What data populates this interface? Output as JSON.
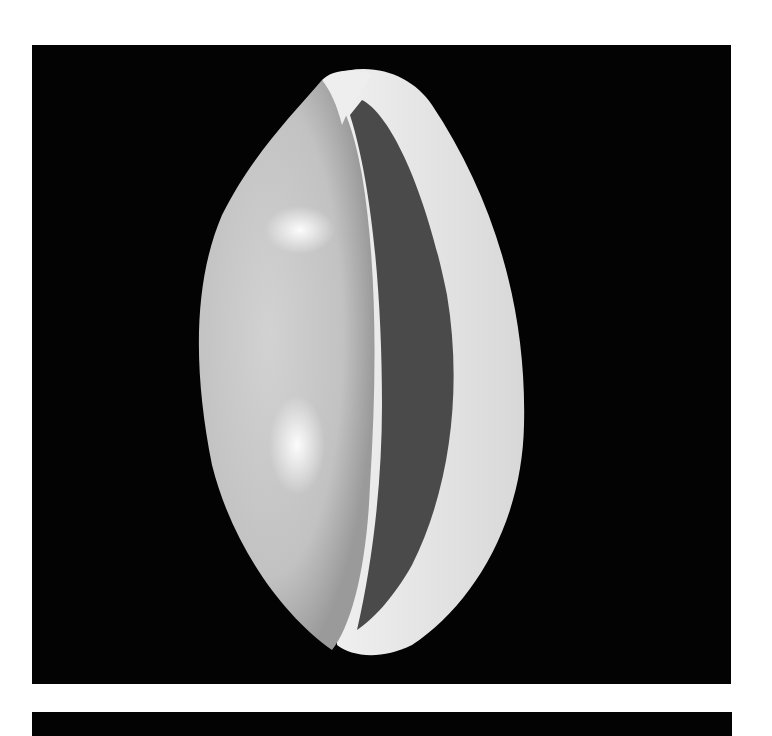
{
  "image": {
    "subject": "cowrie shell, aperture view, grayscale photograph",
    "background_color": "#030303",
    "page_color": "#ffffff",
    "shell_colors": {
      "body": "#c9c9c9",
      "highlight": "#f4f4f4",
      "aperture": "#4a4a4a",
      "lip": "#e6e6e6"
    }
  }
}
